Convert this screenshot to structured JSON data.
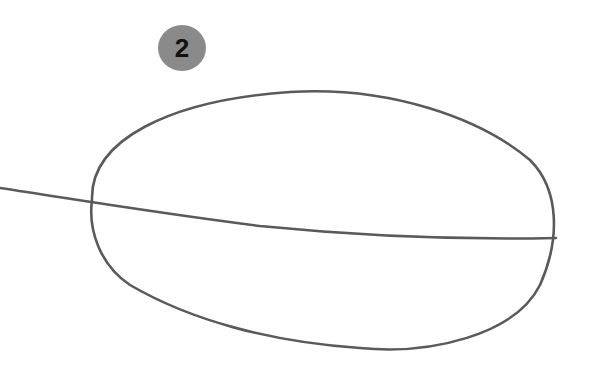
{
  "figure": {
    "badge_number": "2",
    "stroke_color": "#5a5a5a",
    "badge_color": "#8a8a8a",
    "shapes": [
      {
        "type": "ellipse",
        "description": "hand-drawn oval"
      },
      {
        "type": "line",
        "description": "line entering from left, crossing oval to its right edge"
      }
    ]
  }
}
